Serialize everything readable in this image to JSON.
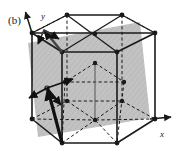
{
  "figure": {
    "panel_label": "(b)",
    "background_color": "#ffffff",
    "line_color": "#1a1a1a",
    "plane_fill_color": "#b3b3b3",
    "plane_opacity": 0.72,
    "atom_color": "#1a1a1a",
    "vector_color": "#111111"
  },
  "axes": {
    "x": {
      "label": "x",
      "label_x": 162,
      "label_y": 137,
      "start": [
        150,
        119
      ],
      "end": [
        172,
        117
      ]
    },
    "y": {
      "label": "y",
      "label_x": 44,
      "label_y": 17,
      "start": [
        32,
        33
      ],
      "end": [
        25,
        11
      ]
    }
  },
  "geometry": {
    "top_hexagon": [
      [
        32,
        33
      ],
      [
        67,
        15
      ],
      [
        122,
        15
      ],
      [
        155,
        33
      ],
      [
        117,
        52
      ],
      [
        62,
        52
      ]
    ],
    "bottom_hexagon": [
      [
        32,
        119
      ],
      [
        67,
        101
      ],
      [
        122,
        101
      ],
      [
        155,
        119
      ],
      [
        117,
        143
      ],
      [
        62,
        143
      ]
    ],
    "top_center": [
      95,
      34
    ],
    "bottom_center": [
      95,
      120
    ],
    "mid_atoms": [
      [
        95,
        63
      ],
      [
        65,
        82
      ],
      [
        124,
        82
      ]
    ],
    "mid_center": [
      95,
      86
    ],
    "vertical_edges": [
      [
        32,
        33,
        32,
        119
      ],
      [
        67,
        15,
        67,
        101
      ],
      [
        122,
        15,
        122,
        101
      ],
      [
        155,
        33,
        155,
        119
      ],
      [
        117,
        52,
        117,
        143
      ],
      [
        62,
        52,
        62,
        143
      ]
    ]
  },
  "slip_plane": {
    "polygon": [
      [
        28,
        43
      ],
      [
        140,
        22
      ],
      [
        150,
        118
      ],
      [
        38,
        137
      ]
    ],
    "label": "slip-plane"
  },
  "vectors": [
    {
      "name": "burgers-vector-main",
      "from": [
        62,
        143
      ],
      "to": [
        47,
        88
      ],
      "width": 3.2
    },
    {
      "name": "burgers-vector-upper",
      "from": [
        62,
        52
      ],
      "to": [
        44,
        30
      ],
      "width": 2.4
    },
    {
      "name": "burgers-vector-lower-right",
      "from": [
        47,
        88
      ],
      "to": [
        72,
        78
      ],
      "width": 1.6
    },
    {
      "name": "burgers-vector-lower-down",
      "from": [
        47,
        88
      ],
      "to": [
        60,
        104
      ],
      "width": 1.6
    },
    {
      "name": "burgers-vector-lower-left",
      "from": [
        47,
        88
      ],
      "to": [
        30,
        98
      ],
      "width": 1.6
    },
    {
      "name": "burgers-vector-upper-spoke",
      "from": [
        44,
        30
      ],
      "to": [
        58,
        38
      ],
      "width": 1.6
    }
  ],
  "dashed_segments": {
    "description": "hidden edges drawn dashed",
    "label": "hidden-edges"
  }
}
